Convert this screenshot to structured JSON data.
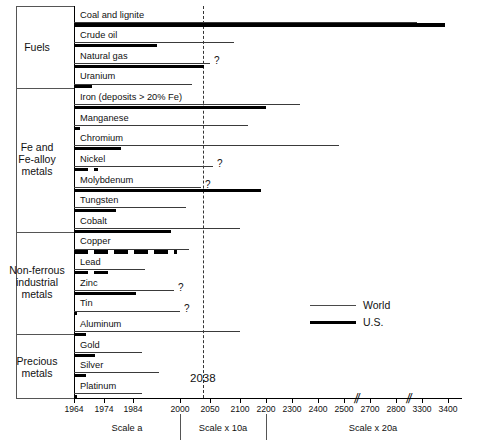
{
  "chart_data": {
    "type": "bar",
    "title": "",
    "xlabel": "",
    "ylabel": "",
    "orientation": "horizontal",
    "grid": false,
    "legend_position": "right-middle",
    "legend": [
      {
        "name": "World",
        "style": "thin-line"
      },
      {
        "name": "U.S.",
        "style": "thick-line"
      }
    ],
    "annotations": [
      {
        "text": "2038",
        "x": 2038,
        "style": "vertical-dashed-line"
      }
    ],
    "axis": {
      "tick_labels": [
        "1964",
        "1974",
        "1984",
        "2000",
        "2050",
        "2100",
        "2200",
        "2300",
        "2400",
        "2500",
        "2700",
        "2800",
        "3300",
        "3400"
      ],
      "breaks": [
        "between 2500 and 2700",
        "between 2800 and 3300"
      ],
      "zones": [
        {
          "label": "Scale a",
          "from": "1964",
          "to": "1990"
        },
        {
          "label": "Scale x 10a",
          "from": "2000",
          "to": "2100"
        },
        {
          "label": "Scale x 20a",
          "from": "2100",
          "to": "3400"
        }
      ]
    },
    "groups": [
      {
        "name": "Fuels",
        "items": [
          {
            "category": "Coal and lignite",
            "world": 3200,
            "us": 3390,
            "world_uncertain": false,
            "us_uncertain": false,
            "us_dashed": false
          },
          {
            "category": "Crude oil",
            "world": 2090,
            "us": 1992,
            "world_uncertain": false,
            "us_uncertain": false,
            "us_dashed": false
          },
          {
            "category": "Natural gas",
            "world": 2050,
            "us": 2040,
            "world_uncertain": true,
            "us_uncertain": false,
            "us_dashed": false
          },
          {
            "category": "Uranium",
            "world": 2020,
            "us": 1970,
            "world_uncertain": false,
            "us_uncertain": false,
            "us_dashed": false
          }
        ]
      },
      {
        "name": "Fe and Fe-alloy metals",
        "items": [
          {
            "category": "Iron (deposits > 20% Fe)",
            "world": 2330,
            "us": 2200,
            "world_uncertain": false,
            "us_uncertain": false,
            "us_dashed": false
          },
          {
            "category": "Manganese",
            "world": 2130,
            "us": 1966,
            "world_uncertain": false,
            "us_uncertain": false,
            "us_dashed": false
          },
          {
            "category": "Chromium",
            "world": 2480,
            "us": 1980,
            "world_uncertain": false,
            "us_uncertain": false,
            "us_dashed": false
          },
          {
            "category": "Nickel",
            "world": 2055,
            "us": 1972,
            "world_uncertain": true,
            "us_uncertain": false,
            "us_dashed": true
          },
          {
            "category": "Molybdenum",
            "world": 2035,
            "us": 2180,
            "world_uncertain": true,
            "us_uncertain": false,
            "us_dashed": false
          }
        ]
      },
      {
        "name": "Non-ferrous industrial metals",
        "items": [
          {
            "category": "Tungsten",
            "world": 2010,
            "us": 1978,
            "world_uncertain": false,
            "us_uncertain": false,
            "us_dashed": false
          },
          {
            "category": "Cobalt",
            "world": 2100,
            "us": 1997,
            "world_uncertain": false,
            "us_uncertain": false,
            "us_dashed": false
          },
          {
            "category": "Copper",
            "world": 2015,
            "us": 1999,
            "world_uncertain": false,
            "us_uncertain": false,
            "us_dashed": true
          },
          {
            "category": "Lead",
            "world": 1988,
            "us": 1977,
            "world_uncertain": false,
            "us_uncertain": false,
            "us_dashed": true
          },
          {
            "category": "Zinc",
            "world": 1998,
            "us": 1985,
            "world_uncertain": true,
            "us_uncertain": false,
            "us_dashed": false
          },
          {
            "category": "Tin",
            "world": 2000,
            "us": 1964,
            "world_uncertain": true,
            "us_uncertain": false,
            "us_dashed": false
          },
          {
            "category": "Aluminum",
            "world": 2100,
            "us": 1968,
            "world_uncertain": false,
            "us_uncertain": false,
            "us_dashed": false
          }
        ]
      },
      {
        "name": "Precious metals",
        "items": [
          {
            "category": "Gold",
            "world": 1987,
            "us": 1971,
            "world_uncertain": false,
            "us_uncertain": false,
            "us_dashed": false
          },
          {
            "category": "Silver",
            "world": 1993,
            "us": 1968,
            "world_uncertain": false,
            "us_uncertain": false,
            "us_dashed": false
          },
          {
            "category": "Platinum",
            "world": 1987,
            "us": 1964,
            "world_uncertain": false,
            "us_uncertain": false,
            "us_dashed": false
          }
        ]
      }
    ]
  },
  "groups": {
    "fuels": "Fuels",
    "fe_alloy_line1": "Fe and",
    "fe_alloy_line2": "Fe-alloy",
    "fe_alloy_line3": "metals",
    "nonferrous_line1": "Non-ferrous",
    "nonferrous_line2": "industrial",
    "nonferrous_line3": "metals",
    "precious_line1": "Precious",
    "precious_line2": "metals"
  },
  "rows": [
    {
      "label": "Coal and lignite"
    },
    {
      "label": "Crude oil"
    },
    {
      "label": "Natural gas"
    },
    {
      "label": "Uranium"
    },
    {
      "label": "Iron (deposits > 20% Fe)"
    },
    {
      "label": "Manganese"
    },
    {
      "label": "Chromium"
    },
    {
      "label": "Nickel"
    },
    {
      "label": "Molybdenum"
    },
    {
      "label": "Tungsten"
    },
    {
      "label": "Cobalt"
    },
    {
      "label": "Copper"
    },
    {
      "label": "Lead"
    },
    {
      "label": "Zinc"
    },
    {
      "label": "Tin"
    },
    {
      "label": "Aluminum"
    },
    {
      "label": "Gold"
    },
    {
      "label": "Silver"
    },
    {
      "label": "Platinum"
    }
  ],
  "uncertainty_marker": "?",
  "ticks": [
    {
      "label": "1964"
    },
    {
      "label": "1974"
    },
    {
      "label": "1984"
    },
    {
      "label": "2000"
    },
    {
      "label": "2050"
    },
    {
      "label": "2100"
    },
    {
      "label": "2200"
    },
    {
      "label": "2300"
    },
    {
      "label": "2400"
    },
    {
      "label": "2500"
    },
    {
      "label": "2700"
    },
    {
      "label": "2800"
    },
    {
      "label": "3300"
    },
    {
      "label": "3400"
    }
  ],
  "scales": {
    "a": "Scale a",
    "x10a": "Scale x 10a",
    "x20a": "Scale x 20a"
  },
  "marker": {
    "year_2038": "2038"
  },
  "legend": {
    "world": "World",
    "us": "U.S."
  }
}
